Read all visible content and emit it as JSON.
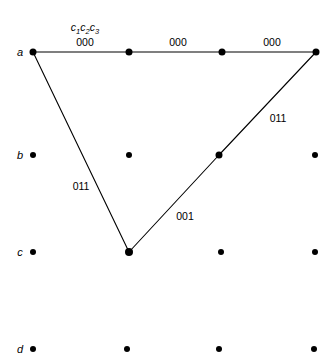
{
  "figure": {
    "width": 336,
    "height": 362,
    "background": "#ffffff",
    "ink_color": "#000000"
  },
  "header": {
    "sequence_label_parts": [
      "c",
      "1",
      "c",
      "2",
      "c",
      "3"
    ],
    "sequence_label_text": "c1c2c3",
    "x": 85,
    "y": 29
  },
  "row_labels": [
    {
      "name": "row-label-a",
      "text": "a",
      "x": 20,
      "y": 52
    },
    {
      "name": "row-label-b",
      "text": "b",
      "x": 20,
      "y": 155
    },
    {
      "name": "row-label-c",
      "text": "c",
      "x": 20,
      "y": 252
    },
    {
      "name": "row-label-d",
      "text": "d",
      "x": 20,
      "y": 349
    }
  ],
  "nodes": [
    {
      "name": "node-a1",
      "row": "a",
      "col": 1,
      "x": 33,
      "y": 52,
      "size": 7,
      "on_path": true
    },
    {
      "name": "node-a2",
      "row": "a",
      "col": 2,
      "x": 129,
      "y": 52,
      "size": 7,
      "on_path": true
    },
    {
      "name": "node-a3",
      "row": "a",
      "col": 3,
      "x": 222,
      "y": 52,
      "size": 7,
      "on_path": true
    },
    {
      "name": "node-a4",
      "row": "a",
      "col": 4,
      "x": 316,
      "y": 52,
      "size": 7,
      "on_path": true
    },
    {
      "name": "node-b1",
      "row": "b",
      "col": 1,
      "x": 33,
      "y": 155,
      "size": 6,
      "on_path": false
    },
    {
      "name": "node-b2",
      "row": "b",
      "col": 2,
      "x": 129,
      "y": 155,
      "size": 6,
      "on_path": false
    },
    {
      "name": "node-b3",
      "row": "b",
      "col": 3,
      "x": 219,
      "y": 155,
      "size": 7,
      "on_path": true
    },
    {
      "name": "node-b4",
      "row": "b",
      "col": 4,
      "x": 315,
      "y": 155,
      "size": 6,
      "on_path": false
    },
    {
      "name": "node-c1",
      "row": "c",
      "col": 1,
      "x": 33,
      "y": 252,
      "size": 6,
      "on_path": false
    },
    {
      "name": "node-c2",
      "row": "c",
      "col": 2,
      "x": 129,
      "y": 252,
      "size": 8,
      "on_path": true
    },
    {
      "name": "node-c3",
      "row": "c",
      "col": 3,
      "x": 221,
      "y": 252,
      "size": 6,
      "on_path": false
    },
    {
      "name": "node-c4",
      "row": "c",
      "col": 4,
      "x": 315,
      "y": 252,
      "size": 6,
      "on_path": false
    },
    {
      "name": "node-d1",
      "row": "d",
      "col": 1,
      "x": 33,
      "y": 349,
      "size": 6,
      "on_path": false
    },
    {
      "name": "node-d2",
      "row": "d",
      "col": 2,
      "x": 127,
      "y": 349,
      "size": 6,
      "on_path": false
    },
    {
      "name": "node-d3",
      "row": "d",
      "col": 3,
      "x": 219,
      "y": 349,
      "size": 6,
      "on_path": false
    },
    {
      "name": "node-d4",
      "row": "d",
      "col": 4,
      "x": 314,
      "y": 349,
      "size": 6,
      "on_path": false
    }
  ],
  "edges": [
    {
      "name": "edge-a1-a2",
      "x1": 33,
      "y1": 52,
      "x2": 129,
      "y2": 52,
      "label": "000"
    },
    {
      "name": "edge-a2-a3",
      "x1": 129,
      "y1": 52,
      "x2": 222,
      "y2": 52,
      "label": "000"
    },
    {
      "name": "edge-a3-a4",
      "x1": 222,
      "y1": 52,
      "x2": 316,
      "y2": 52,
      "label": "000"
    },
    {
      "name": "edge-a1-c2",
      "x1": 33,
      "y1": 52,
      "x2": 129,
      "y2": 252,
      "label": "011"
    },
    {
      "name": "edge-c2-b3",
      "x1": 129,
      "y1": 252,
      "x2": 219,
      "y2": 155,
      "label": "001"
    },
    {
      "name": "edge-b3-a4",
      "x1": 219,
      "y1": 155,
      "x2": 316,
      "y2": 52,
      "label": "011"
    }
  ],
  "edge_labels": [
    {
      "name": "edge-label-000-1",
      "text": "000",
      "x": 85,
      "y": 42
    },
    {
      "name": "edge-label-000-2",
      "text": "000",
      "x": 178,
      "y": 42
    },
    {
      "name": "edge-label-000-3",
      "text": "000",
      "x": 272,
      "y": 42
    },
    {
      "name": "edge-label-011-left",
      "text": "011",
      "x": 81,
      "y": 186
    },
    {
      "name": "edge-label-001-mid",
      "text": "001",
      "x": 185,
      "y": 216
    },
    {
      "name": "edge-label-011-right",
      "text": "011",
      "x": 278,
      "y": 118
    }
  ]
}
